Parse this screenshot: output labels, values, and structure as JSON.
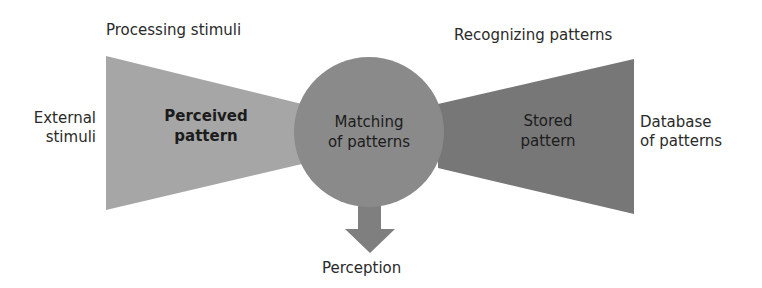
{
  "diagram": {
    "labels": {
      "processing": "Processing stimuli",
      "recognizing": "Recognizing patterns",
      "external_line1": "External",
      "external_line2": "stimuli",
      "database_line1": "Database",
      "database_line2": "of patterns",
      "perception": "Perception"
    },
    "shapes": {
      "perceived_line1": "Perceived",
      "perceived_line2": "pattern",
      "matching_line1": "Matching",
      "matching_line2": "of patterns",
      "stored_line1": "Stored",
      "stored_line2": "pattern"
    },
    "colors": {
      "left_funnel": "#a6a6a6",
      "circle": "#8a8a8a",
      "right_funnel": "#777777",
      "arrow": "#7f7f7f"
    }
  }
}
